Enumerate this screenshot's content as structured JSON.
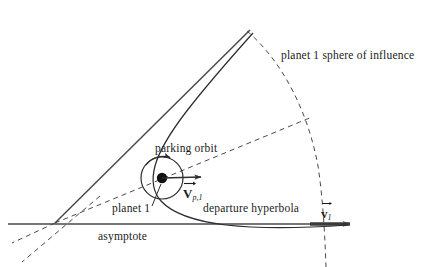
{
  "figure": {
    "kind": "interplanetary-departure-hyperbola-diagram",
    "background_color": "#ffffff",
    "ink_color": "#3a3a3a",
    "text_color": "#1b1b1b"
  },
  "labels": {
    "sphere_of_influence": "planet 1 sphere of influence",
    "parking_orbit": "parking orbit",
    "planet": "planet 1",
    "departure_hyperbola": "departure hyperbola",
    "asymptote": "asymptote",
    "v_planet_base": "V",
    "v_planet_sub": "p,1",
    "v_one_base": "v",
    "v_one_sub": "1"
  },
  "geometry": {
    "planet_center": [
      162,
      178
    ],
    "parking_orbit_radius": 21,
    "asymptote_y": 224,
    "asymptote_x_start": 8,
    "asymptote_x_end": 357,
    "convergence_point": [
      55,
      223
    ],
    "tangent_line_end": [
      250,
      30
    ],
    "soi_arc_top": [
      248,
      33
    ],
    "soi_arc_bottom": [
      326,
      267
    ],
    "v_planet_arrow_end": [
      205,
      177
    ],
    "v_one_segment_start": [
      310,
      224
    ]
  }
}
